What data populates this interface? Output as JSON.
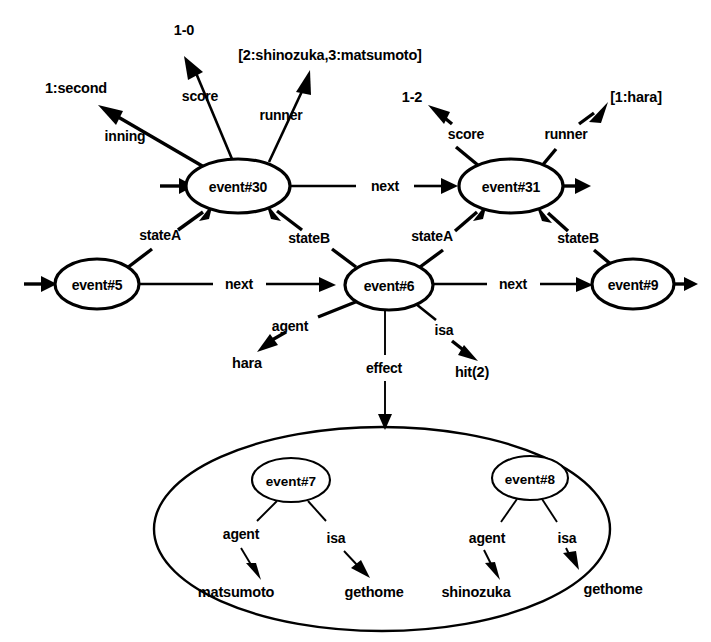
{
  "diagram": {
    "background_color": "#ffffff",
    "ink_color": "#000000",
    "nodes": [
      {
        "id": "event30",
        "label": "event#30",
        "cx": 238,
        "cy": 186,
        "rx": 52,
        "ry": 27
      },
      {
        "id": "event31",
        "label": "event#31",
        "cx": 511,
        "cy": 186,
        "rx": 52,
        "ry": 27
      },
      {
        "id": "event5",
        "label": "event#5",
        "cx": 97,
        "cy": 284,
        "rx": 42,
        "ry": 25
      },
      {
        "id": "event6",
        "label": "event#6",
        "cx": 389,
        "cy": 285,
        "rx": 44,
        "ry": 25
      },
      {
        "id": "event9",
        "label": "event#9",
        "cx": 633,
        "cy": 284,
        "rx": 41,
        "ry": 25
      },
      {
        "id": "event7",
        "label": "event#7",
        "cx": 291,
        "cy": 480,
        "rx": 39,
        "ry": 22
      },
      {
        "id": "event8",
        "label": "event#8",
        "cx": 530,
        "cy": 478,
        "rx": 38,
        "ry": 22
      }
    ],
    "container": {
      "id": "effect-set",
      "label": "",
      "cx": 382,
      "cy": 529,
      "rx": 228,
      "ry": 102
    },
    "value_labels": [
      {
        "id": "inning-value",
        "text": "1:second",
        "x": 76,
        "y": 88
      },
      {
        "id": "score30-value",
        "text": "1-0",
        "x": 184,
        "y": 30
      },
      {
        "id": "runner30-value",
        "text": "[2:shinozuka,3:matsumoto]",
        "x": 330,
        "y": 55
      },
      {
        "id": "score31-value",
        "text": "1-2",
        "x": 412,
        "y": 97
      },
      {
        "id": "runner31-value",
        "text": "[1:hara]",
        "x": 636,
        "y": 97
      },
      {
        "id": "agent6-value",
        "text": "hara",
        "x": 247,
        "y": 363
      },
      {
        "id": "isa6-value",
        "text": "hit(2)",
        "x": 472,
        "y": 372
      },
      {
        "id": "agent7-value",
        "text": "matsumoto",
        "x": 236,
        "y": 592
      },
      {
        "id": "isa7-value",
        "text": "gethome",
        "x": 374,
        "y": 592
      },
      {
        "id": "agent8-value",
        "text": "shinozuka",
        "x": 476,
        "y": 592
      },
      {
        "id": "isa8-value",
        "text": "gethome",
        "x": 613,
        "y": 589
      }
    ],
    "edge_labels": [
      {
        "id": "inning-label",
        "text": "inning",
        "x": 125,
        "y": 136
      },
      {
        "id": "score30-label",
        "text": "score",
        "x": 200,
        "y": 96
      },
      {
        "id": "runner30-label",
        "text": "runner",
        "x": 281,
        "y": 115
      },
      {
        "id": "score31-label",
        "text": "score",
        "x": 466,
        "y": 134
      },
      {
        "id": "runner31-label",
        "text": "runner",
        "x": 566,
        "y": 134
      },
      {
        "id": "stateA30-label",
        "text": "stateA",
        "x": 160,
        "y": 235
      },
      {
        "id": "stateB30-label",
        "text": "stateB",
        "x": 309,
        "y": 238
      },
      {
        "id": "stateA31-label",
        "text": "stateA",
        "x": 432,
        "y": 236
      },
      {
        "id": "stateB31-label",
        "text": "stateB",
        "x": 578,
        "y": 238
      },
      {
        "id": "next5-label",
        "text": "next",
        "x": 239,
        "y": 284
      },
      {
        "id": "next30-label",
        "text": "next",
        "x": 385,
        "y": 186
      },
      {
        "id": "next6-label",
        "text": "next",
        "x": 513,
        "y": 284
      },
      {
        "id": "agent6-label",
        "text": "agent",
        "x": 290,
        "y": 326
      },
      {
        "id": "effect6-label",
        "text": "effect",
        "x": 384,
        "y": 368
      },
      {
        "id": "isa6-label",
        "text": "isa",
        "x": 444,
        "y": 330
      },
      {
        "id": "agent7-label",
        "text": "agent",
        "x": 241,
        "y": 534
      },
      {
        "id": "isa7-label",
        "text": "isa",
        "x": 336,
        "y": 538
      },
      {
        "id": "agent8-label",
        "text": "agent",
        "x": 487,
        "y": 538
      },
      {
        "id": "isa8-label",
        "text": "isa",
        "x": 567,
        "y": 538
      }
    ],
    "relations": [
      {
        "from": "event30",
        "to": "1:second",
        "label": "inning"
      },
      {
        "from": "event30",
        "to": "1-0",
        "label": "score"
      },
      {
        "from": "event30",
        "to": "[2:shinozuka,3:matsumoto]",
        "label": "runner"
      },
      {
        "from": "event30",
        "to": "event31",
        "label": "next"
      },
      {
        "from": "event5",
        "to": "event30",
        "label": "stateA"
      },
      {
        "from": "event6",
        "to": "event30",
        "label": "stateB"
      },
      {
        "from": "event6",
        "to": "event31",
        "label": "stateA"
      },
      {
        "from": "event9",
        "to": "event31",
        "label": "stateB"
      },
      {
        "from": "event31",
        "to": "1-2",
        "label": "score"
      },
      {
        "from": "event31",
        "to": "[1:hara]",
        "label": "runner"
      },
      {
        "from": "event5",
        "to": "event6",
        "label": "next"
      },
      {
        "from": "event6",
        "to": "event9",
        "label": "next"
      },
      {
        "from": "event6",
        "to": "hara",
        "label": "agent"
      },
      {
        "from": "event6",
        "to": "hit(2)",
        "label": "isa"
      },
      {
        "from": "event6",
        "to": "effect-set",
        "label": "effect"
      },
      {
        "from": "event7",
        "to": "matsumoto",
        "label": "agent"
      },
      {
        "from": "event7",
        "to": "gethome",
        "label": "isa"
      },
      {
        "from": "event8",
        "to": "shinozuka",
        "label": "agent"
      },
      {
        "from": "event8",
        "to": "gethome",
        "label": "isa"
      }
    ]
  }
}
